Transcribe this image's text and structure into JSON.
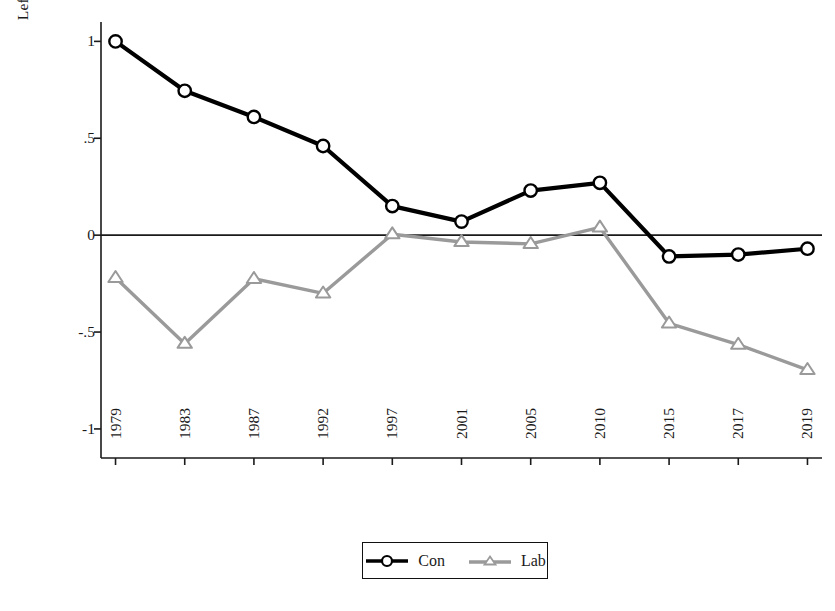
{
  "chart_data": {
    "type": "line",
    "title": "",
    "xlabel": "",
    "ylabel": "Left (−1) vs right (+1)",
    "categories": [
      "1979",
      "1983",
      "1987",
      "1992",
      "1997",
      "2001",
      "2005",
      "2010",
      "2015",
      "2017",
      "2019"
    ],
    "ylim": [
      -1.15,
      1.1
    ],
    "yticks": [
      1,
      0.5,
      0,
      -0.5,
      -1
    ],
    "ytick_labels": [
      "1",
      ".5",
      "0",
      "-.5",
      "-1"
    ],
    "grid": false,
    "zero_line": true,
    "legend_position": "bottom-center",
    "series": [
      {
        "name": "Con",
        "color": "#000000",
        "marker": "circle",
        "values": [
          1.0,
          0.745,
          0.61,
          0.46,
          0.15,
          0.07,
          0.23,
          0.27,
          -0.11,
          -0.1,
          -0.07
        ]
      },
      {
        "name": "Lab",
        "color": "#9a9a9a",
        "marker": "triangle",
        "values": [
          -0.22,
          -0.56,
          -0.225,
          -0.3,
          0.005,
          -0.035,
          -0.045,
          0.04,
          -0.455,
          -0.565,
          -0.695
        ]
      }
    ]
  },
  "legend": {
    "items": [
      {
        "label": "Con",
        "icon": "circle-marker-icon"
      },
      {
        "label": "Lab",
        "icon": "triangle-marker-icon"
      }
    ]
  },
  "colors": {
    "con": "#000000",
    "lab": "#9a9a9a",
    "axis": "#1a1a1a",
    "background": "#ffffff"
  }
}
